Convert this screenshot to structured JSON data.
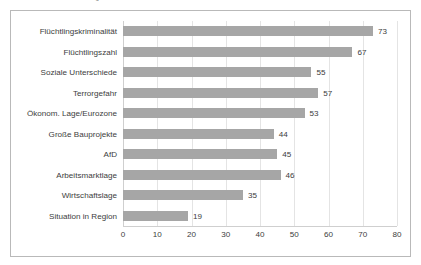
{
  "caption": "in % der Befragten",
  "chart_data": {
    "type": "bar",
    "orientation": "horizontal",
    "title": "",
    "subtitle": "in % der Befragten",
    "xlabel": "",
    "ylabel": "",
    "xlim": [
      0,
      80
    ],
    "xticks": [
      0,
      10,
      20,
      30,
      40,
      50,
      60,
      70,
      80
    ],
    "grid": true,
    "legend": "none",
    "bar_color": "#a6a6a6",
    "categories": [
      "Flüchtlingskriminalität",
      "Flüchtlingszahl",
      "Soziale Unterschiede",
      "Terrorgefahr",
      "Ökonom. Lage/Eurozone",
      "Große Bauprojekte",
      "AfD",
      "Arbeitsmarktlage",
      "Wirtschaftslage",
      "Situation in Region"
    ],
    "values": [
      73,
      67,
      55,
      57,
      53,
      44,
      45,
      46,
      35,
      19
    ],
    "data_labels": [
      "73",
      "67",
      "55",
      "57",
      "53",
      "44",
      "45",
      "46",
      "35",
      "19"
    ]
  }
}
